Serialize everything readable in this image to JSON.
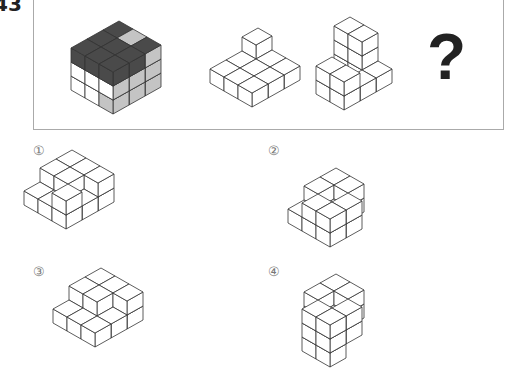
{
  "question": {
    "number": "43",
    "question_mark": "?"
  },
  "options": [
    {
      "label": "①",
      "x": 33,
      "y": 143
    },
    {
      "label": "②",
      "x": 268,
      "y": 143
    },
    {
      "label": "③",
      "x": 33,
      "y": 264
    },
    {
      "label": "④",
      "x": 268,
      "y": 264
    }
  ],
  "colors": {
    "dark": "#4a4a4a",
    "light_gray": "#c4c4c4",
    "white": "#ffffff",
    "stroke": "#333333",
    "box_border": "#aaaaaa"
  },
  "figures": [
    {
      "name": "full-cube",
      "origin": [
        113,
        114
      ],
      "cubes": [
        [
          0,
          0,
          0,
          "w",
          "g",
          "g"
        ],
        [
          1,
          0,
          0,
          "w",
          "g",
          "g"
        ],
        [
          2,
          0,
          0,
          "w",
          "g",
          "g"
        ],
        [
          0,
          1,
          0,
          "w",
          "w",
          "g"
        ],
        [
          0,
          2,
          0,
          "w",
          "w",
          "g"
        ],
        [
          1,
          1,
          0,
          "w",
          "w",
          "w"
        ],
        [
          1,
          2,
          0,
          "w",
          "w",
          "w"
        ],
        [
          2,
          1,
          0,
          "w",
          "w",
          "g"
        ],
        [
          2,
          2,
          0,
          "w",
          "w",
          "g"
        ],
        [
          0,
          0,
          1,
          "w",
          "w",
          "g"
        ],
        [
          1,
          0,
          1,
          "w",
          "w",
          "g"
        ],
        [
          2,
          0,
          1,
          "w",
          "w",
          "g"
        ],
        [
          0,
          1,
          1,
          "w",
          "w",
          "w"
        ],
        [
          0,
          2,
          1,
          "w",
          "w",
          "w"
        ],
        [
          1,
          1,
          1,
          "w",
          "w",
          "w"
        ],
        [
          1,
          2,
          1,
          "w",
          "w",
          "w"
        ],
        [
          2,
          1,
          1,
          "w",
          "w",
          "g"
        ],
        [
          2,
          2,
          1,
          "w",
          "w",
          "g"
        ],
        [
          0,
          0,
          2,
          "d",
          "d",
          "d"
        ],
        [
          1,
          0,
          2,
          "d",
          "d",
          "d"
        ],
        [
          2,
          0,
          2,
          "d",
          "d",
          "g"
        ],
        [
          0,
          1,
          2,
          "d",
          "d",
          "d"
        ],
        [
          0,
          2,
          2,
          "d",
          "d",
          "d"
        ],
        [
          1,
          1,
          2,
          "d",
          "d",
          "d"
        ],
        [
          1,
          2,
          2,
          "d",
          "d",
          "d"
        ],
        [
          2,
          1,
          2,
          "g",
          "d",
          "g"
        ],
        [
          2,
          2,
          2,
          "d",
          "d",
          "d"
        ]
      ]
    },
    {
      "name": "piece-a",
      "origin": [
        252,
        107
      ],
      "cubes": [
        [
          0,
          0,
          0
        ],
        [
          1,
          0,
          0
        ],
        [
          2,
          0,
          0
        ],
        [
          0,
          1,
          0
        ],
        [
          1,
          1,
          0
        ],
        [
          2,
          1,
          0
        ],
        [
          0,
          2,
          0
        ],
        [
          1,
          2,
          0
        ],
        [
          2,
          2,
          0
        ],
        [
          2,
          2,
          1
        ]
      ]
    },
    {
      "name": "piece-b",
      "origin": [
        344,
        110
      ],
      "cubes": [
        [
          0,
          0,
          0
        ],
        [
          1,
          0,
          0
        ],
        [
          2,
          0,
          0
        ],
        [
          0,
          1,
          0
        ],
        [
          2,
          1,
          0
        ],
        [
          2,
          2,
          0
        ],
        [
          0,
          1,
          1
        ],
        [
          0,
          0,
          1
        ],
        [
          2,
          2,
          1
        ],
        [
          2,
          2,
          2
        ],
        [
          2,
          1,
          1
        ],
        [
          2,
          1,
          2
        ]
      ]
    }
  ],
  "option_figures": [
    {
      "name": "option-1",
      "origin": [
        66,
        229
      ],
      "cubes": [
        [
          0,
          0,
          0
        ],
        [
          0,
          0,
          1
        ],
        [
          1,
          0,
          0
        ],
        [
          2,
          0,
          0
        ],
        [
          0,
          1,
          0
        ],
        [
          1,
          1,
          0
        ],
        [
          2,
          1,
          0
        ],
        [
          0,
          2,
          0
        ],
        [
          1,
          2,
          0
        ],
        [
          2,
          2,
          0
        ],
        [
          1,
          2,
          1
        ],
        [
          2,
          2,
          1
        ],
        [
          2,
          1,
          1
        ],
        [
          2,
          0,
          1
        ],
        [
          1,
          1,
          1
        ]
      ]
    },
    {
      "name": "option-2",
      "origin": [
        330,
        247
      ],
      "cubes": [
        [
          0,
          0,
          0
        ],
        [
          0,
          0,
          1
        ],
        [
          1,
          0,
          0
        ],
        [
          1,
          0,
          1
        ],
        [
          0,
          1,
          0
        ],
        [
          0,
          1,
          1
        ],
        [
          1,
          1,
          0
        ],
        [
          2,
          1,
          0
        ],
        [
          2,
          2,
          0
        ],
        [
          1,
          2,
          0
        ],
        [
          0,
          2,
          0
        ],
        [
          1,
          2,
          1
        ],
        [
          2,
          2,
          1
        ],
        [
          2,
          1,
          1
        ]
      ]
    },
    {
      "name": "option-3",
      "origin": [
        95,
        347
      ],
      "cubes": [
        [
          0,
          0,
          0
        ],
        [
          1,
          0,
          0
        ],
        [
          2,
          0,
          0
        ],
        [
          0,
          1,
          0
        ],
        [
          1,
          1,
          0
        ],
        [
          2,
          1,
          0
        ],
        [
          0,
          2,
          0
        ],
        [
          1,
          2,
          0
        ],
        [
          2,
          2,
          0
        ],
        [
          1,
          2,
          1
        ],
        [
          2,
          2,
          1
        ],
        [
          2,
          1,
          1
        ],
        [
          1,
          1,
          1
        ],
        [
          2,
          0,
          1
        ]
      ]
    },
    {
      "name": "option-4",
      "origin": [
        330,
        367
      ],
      "cubes": [
        [
          0,
          0,
          0
        ],
        [
          0,
          0,
          1
        ],
        [
          0,
          0,
          2
        ],
        [
          0,
          1,
          1
        ],
        [
          0,
          1,
          2
        ],
        [
          1,
          1,
          1
        ],
        [
          1,
          0,
          1
        ],
        [
          1,
          0,
          2
        ],
        [
          0,
          1,
          0
        ],
        [
          1,
          2,
          1
        ],
        [
          2,
          2,
          1
        ],
        [
          2,
          1,
          1
        ],
        [
          2,
          2,
          2
        ],
        [
          1,
          2,
          2
        ],
        [
          2,
          1,
          2
        ]
      ]
    }
  ]
}
